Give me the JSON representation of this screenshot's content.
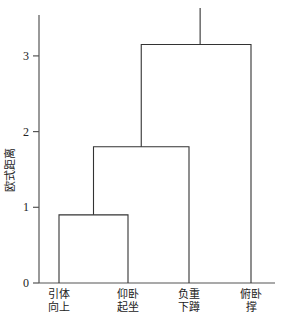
{
  "chart_data": {
    "type": "dendrogram",
    "title": "",
    "xlabel": "",
    "ylabel": "欧式距离",
    "ylim": [
      0,
      3.5
    ],
    "yticks": [
      0,
      1,
      2,
      3
    ],
    "grid": false,
    "legend": null,
    "leaves": [
      {
        "label_line1": "引体",
        "label_line2": "向上",
        "label": "引体向上"
      },
      {
        "label_line1": "仰卧",
        "label_line2": "起坐",
        "label": "仰卧起坐"
      },
      {
        "label_line1": "负重",
        "label_line2": "下蹲",
        "label": "负重下蹲"
      },
      {
        "label_line1": "俯卧",
        "label_line2": "撑",
        "label": "俯卧撑"
      }
    ],
    "merges": [
      {
        "left": "引体向上",
        "right": "仰卧起坐",
        "height": 0.9
      },
      {
        "left": "引体向上+仰卧起坐",
        "right": "负重下蹲",
        "height": 1.8
      },
      {
        "left": "引体向上+仰卧起坐+负重下蹲",
        "right": "俯卧撑",
        "height": 3.15
      }
    ]
  }
}
